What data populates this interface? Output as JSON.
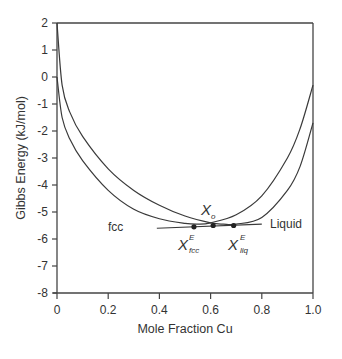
{
  "chart_data": {
    "type": "line",
    "title": "",
    "xlabel": "Mole Fraction Cu",
    "ylabel": "Gibbs Energy (kJ/mol)",
    "xlim": [
      0,
      1
    ],
    "ylim": [
      -8,
      2
    ],
    "xticks": [
      0,
      0.2,
      0.4,
      0.6,
      0.8,
      1.0
    ],
    "xtick_labels": [
      "0",
      "0.2",
      "0.4",
      "0.6",
      "0.8",
      "1.0"
    ],
    "yticks": [
      2,
      1,
      0,
      -1,
      -2,
      -3,
      -4,
      -5,
      -6,
      -7,
      -8
    ],
    "ytick_labels": [
      "2",
      "1",
      "0",
      "-1",
      "-2",
      "-3",
      "-4",
      "-5",
      "-6",
      "-7",
      "-8"
    ],
    "grid": false,
    "series": [
      {
        "name": "fcc",
        "x": [
          0,
          0.02,
          0.05,
          0.1,
          0.2,
          0.3,
          0.4,
          0.5,
          0.55,
          0.6,
          0.7,
          0.8,
          0.9,
          0.95,
          1.0
        ],
        "y": [
          0,
          -1.5,
          -2.3,
          -3.1,
          -4.2,
          -4.9,
          -5.25,
          -5.42,
          -5.45,
          -5.4,
          -5.1,
          -4.4,
          -3.0,
          -1.9,
          -0.3
        ]
      },
      {
        "name": "Liquid",
        "x": [
          0,
          0.02,
          0.05,
          0.1,
          0.2,
          0.3,
          0.4,
          0.5,
          0.6,
          0.65,
          0.7,
          0.8,
          0.9,
          0.95,
          1.0
        ],
        "y": [
          2,
          -0.3,
          -1.3,
          -2.2,
          -3.4,
          -4.2,
          -4.75,
          -5.15,
          -5.4,
          -5.45,
          -5.45,
          -5.2,
          -4.2,
          -3.3,
          -1.7
        ]
      }
    ],
    "tangent_line": {
      "x": [
        0.39,
        0.8
      ],
      "y": [
        -5.6,
        -5.45
      ]
    },
    "points": [
      {
        "name": "X_fcc^E",
        "x": 0.535,
        "y": -5.55
      },
      {
        "name": "X_o",
        "x": 0.61,
        "y": -5.5
      },
      {
        "name": "X_liq^E",
        "x": 0.69,
        "y": -5.5
      }
    ],
    "annotations": {
      "fcc_label": "fcc",
      "liquid_label": "Liquid",
      "xo_main": "X",
      "xo_sub": "o",
      "xfcc_main": "X",
      "xfcc_sup": "E",
      "xfcc_sub": "fcc",
      "xliq_main": "X",
      "xliq_sup": "E",
      "xliq_sub": "liq"
    }
  }
}
